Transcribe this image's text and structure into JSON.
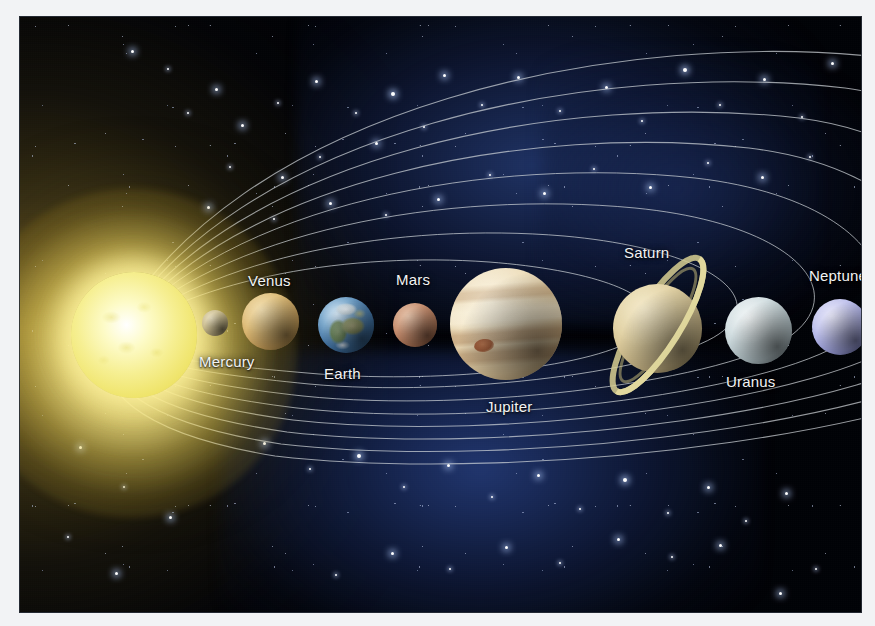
{
  "image": {
    "title": "Solar System Diagram",
    "subject": "The Sun and the eight planets shown in order of distance with elliptical orbit lines over a starfield",
    "frame_color": "#f2f3f5",
    "space_color": "#000206",
    "nebula_color": "#22386c",
    "orbit_line_color": "#cfd4d8",
    "label_color": "#f2f3f4"
  },
  "sun": {
    "name": "Sun",
    "core_color": "#f6ef92",
    "glow_color": "#fff5a0"
  },
  "planets": [
    {
      "label": "Mercury",
      "color": "#cbbd90",
      "order": 1
    },
    {
      "label": "Venus",
      "color": "#e0bf7c",
      "order": 2
    },
    {
      "label": "Earth",
      "color": "#3f6f9e",
      "order": 3
    },
    {
      "label": "Mars",
      "color": "#c89172",
      "order": 4
    },
    {
      "label": "Jupiter",
      "color": "#efe0c0",
      "order": 5
    },
    {
      "label": "Saturn",
      "color": "#e2d2a4",
      "order": 6
    },
    {
      "label": "Uranus",
      "color": "#d3dfe2",
      "order": 7
    },
    {
      "label": "Neptune",
      "color": "#c2c4ee",
      "order": 8
    }
  ],
  "features": {
    "saturn_rings": "ring-system",
    "jupiter_spot": "great-red-spot",
    "orbit_count": 8
  }
}
